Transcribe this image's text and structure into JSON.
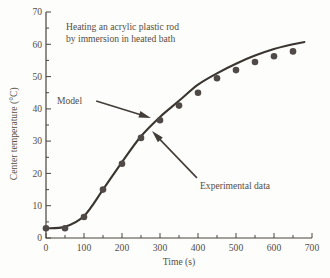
{
  "chart_data": {
    "type": "line",
    "title_lines": [
      "Heating an acrylic plastic rod",
      "by immersion in heated bath"
    ],
    "xlabel": "Time (s)",
    "ylabel": "Center temperature (°C)",
    "xlim": [
      0,
      700
    ],
    "ylim": [
      0,
      70
    ],
    "x_major_ticks": [
      0,
      100,
      200,
      300,
      400,
      500,
      600,
      700
    ],
    "x_minor_step": 50,
    "y_major_ticks": [
      0,
      10,
      20,
      30,
      40,
      50,
      60,
      70
    ],
    "y_minor_step": 5,
    "grid": false,
    "legend": "none (labels via arrow annotations)",
    "series": [
      {
        "name": "Model",
        "type": "line",
        "x": [
          0,
          50,
          100,
          150,
          200,
          250,
          300,
          350,
          400,
          450,
          500,
          550,
          600,
          650,
          680
        ],
        "y": [
          3,
          3.5,
          6.8,
          15,
          23.5,
          31.5,
          37.5,
          42.5,
          47.5,
          51,
          54,
          56.5,
          58.5,
          60,
          60.7
        ]
      },
      {
        "name": "Experimental data",
        "type": "scatter",
        "x": [
          0,
          50,
          100,
          150,
          200,
          250,
          300,
          350,
          400,
          450,
          500,
          550,
          600,
          650
        ],
        "y": [
          3,
          3,
          6.5,
          15,
          23,
          31,
          36.5,
          41,
          45,
          49.5,
          52,
          54.5,
          56.3,
          57.8
        ]
      }
    ],
    "annotations": [
      {
        "label": "Model",
        "arrow_from_xy": [
          132,
          42.4
        ],
        "arrow_to_xy": [
          276,
          37.2
        ]
      },
      {
        "label": "Experimental data",
        "arrow_from_xy": [
          397,
          18.6
        ],
        "arrow_to_xy": [
          279,
          33.1
        ]
      }
    ],
    "colors": {
      "background": "#fdfdfb",
      "axis": "#4a443e",
      "tick_text": "#544d46",
      "curve": "#3a3531",
      "points": "#4f4a47",
      "annotation": "#423d39"
    }
  }
}
